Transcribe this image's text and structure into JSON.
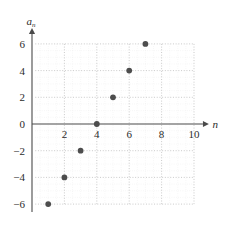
{
  "chart_data": {
    "type": "scatter",
    "title": "",
    "subtitle": "",
    "xlabel": "n",
    "ylabel": "a_n",
    "ylabel_base": "a",
    "ylabel_subscript": "n",
    "x": [
      1,
      2,
      3,
      4,
      5,
      6,
      7
    ],
    "values": [
      -6,
      -4,
      -2,
      0,
      2,
      4,
      6
    ],
    "points": [
      {
        "x": 1,
        "y": -6
      },
      {
        "x": 2,
        "y": -4
      },
      {
        "x": 3,
        "y": -2
      },
      {
        "x": 4,
        "y": 0
      },
      {
        "x": 5,
        "y": 2
      },
      {
        "x": 6,
        "y": 4
      },
      {
        "x": 7,
        "y": 6
      }
    ],
    "xlim": [
      0,
      10.8
    ],
    "ylim": [
      -7,
      7
    ],
    "xticks": [
      2,
      4,
      6,
      8,
      10
    ],
    "xtick_labels": [
      "2",
      "4",
      "6",
      "8",
      "10"
    ],
    "yticks": [
      6,
      4,
      2,
      0,
      -2,
      -4,
      -6
    ],
    "ytick_labels": [
      "6",
      "4",
      "2",
      "0",
      "-2",
      "-4",
      "-6"
    ],
    "grid": true,
    "grid_style": "dotted",
    "minor_grid": true,
    "legend": null,
    "legend_position": "none",
    "marker": "filled-circle",
    "marker_color": "#4d4d4d",
    "grid_color": "#bcbcbc",
    "minor_grid_color": "#e2e2e2",
    "axis_color": "#4a4a4a",
    "background_color": "#ffffff"
  },
  "axis": {
    "x_name": "n",
    "y_name_base": "a",
    "y_name_sub": "n"
  },
  "ticks": {
    "x": [
      "2",
      "4",
      "6",
      "8",
      "10"
    ],
    "y": [
      "6",
      "4",
      "2",
      "0",
      "-2",
      "-4",
      "-6"
    ]
  }
}
